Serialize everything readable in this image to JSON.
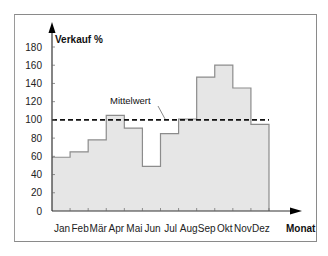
{
  "chart_data": {
    "type": "bar",
    "subtype": "step",
    "title": "",
    "ylabel": "Verkauf %",
    "xlabel": "Monat",
    "categories": [
      "Jan",
      "Feb",
      "Mär",
      "Apr",
      "Mai",
      "Jun",
      "Jul",
      "Aug",
      "Sep",
      "Okt",
      "Nov",
      "Dez"
    ],
    "values": [
      59,
      65,
      78,
      105,
      91,
      49,
      85,
      101,
      147,
      160,
      135,
      95
    ],
    "yticks": [
      0,
      20,
      40,
      60,
      80,
      100,
      120,
      140,
      160,
      180
    ],
    "ylim": [
      0,
      180
    ],
    "reference_line": {
      "label": "Mittelwert",
      "value": 100,
      "style": "dashed"
    },
    "grid": false,
    "legend": null
  },
  "colors": {
    "fill": "#e6e6e6",
    "step_line": "#8c8c8c",
    "mean_line": "#111111",
    "axis": "#333333"
  }
}
